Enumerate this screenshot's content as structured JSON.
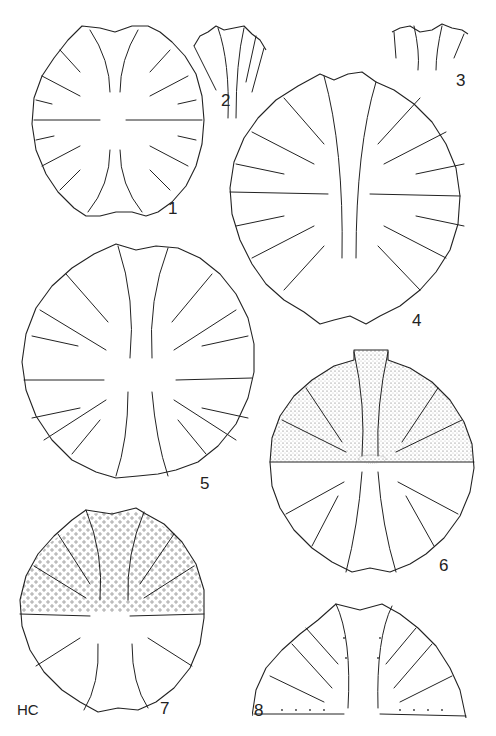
{
  "plate": {
    "title": "",
    "initials": "HC",
    "background": "#ffffff",
    "ink_color": "#222222"
  },
  "figures": [
    {
      "number": "1",
      "description": "whole cell, oval, deeply incised lobes with dentate margin"
    },
    {
      "number": "2",
      "description": "detail of polar lobe apex"
    },
    {
      "number": "3",
      "description": "detail of polar lobe margin"
    },
    {
      "number": "4",
      "description": "whole cell, large, spinose forked margin"
    },
    {
      "number": "5",
      "description": "whole cell, circular, clavate incisions"
    },
    {
      "number": "6",
      "description": "whole cell, upper semicell stippled with concentric zones"
    },
    {
      "number": "7",
      "description": "whole cell, upper semicell with scattered granules"
    },
    {
      "number": "8",
      "description": "semicell detail with marginal spinules"
    }
  ]
}
